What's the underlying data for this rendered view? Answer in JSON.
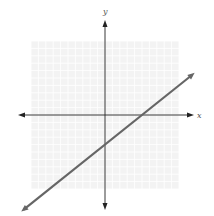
{
  "chart_data": {
    "type": "line",
    "title": "",
    "xlabel": "x",
    "ylabel": "y",
    "xlim": [
      -10,
      10
    ],
    "ylim": [
      -10,
      10
    ],
    "grid": true,
    "series": [
      {
        "name": "line",
        "equation": "y = 0.8x - 4",
        "slope": 0.8,
        "intercept": -4,
        "x": [
          -11,
          11.8
        ],
        "y": [
          -12.8,
          5.44
        ],
        "color": "#666666"
      }
    ],
    "x_intercept": 5,
    "y_intercept": -4
  },
  "colors": {
    "grid": "#e6e6e6",
    "grid_bg": "#f3f3f3",
    "axis": "#222222",
    "line": "#6a6a6a"
  }
}
